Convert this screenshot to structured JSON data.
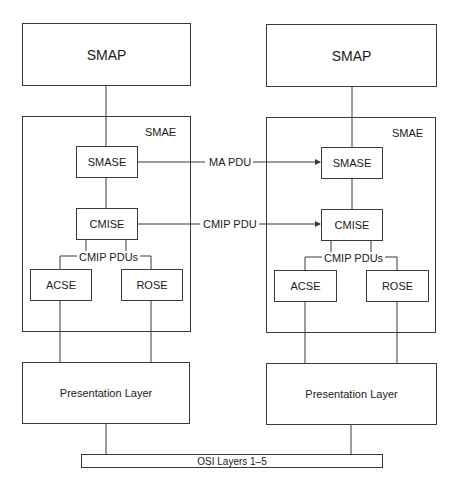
{
  "diagram": {
    "left_stack": {
      "smap": "SMAP",
      "smae": "SMAE",
      "smase": "SMASE",
      "cmise": "CMISE",
      "pdus_label": "CMIP PDUs",
      "acse": "ACSE",
      "rose": "ROSE",
      "presentation": "Presentation Layer"
    },
    "right_stack": {
      "smap": "SMAP",
      "smae": "SMAE",
      "smase": "SMASE",
      "cmise": "CMISE",
      "pdus_label": "CMIP PDUs",
      "acse": "ACSE",
      "rose": "ROSE",
      "presentation": "Presentation Layer"
    },
    "arrows": {
      "ma_pdu": "MA PDU",
      "cmip_pdu": "CMIP PDU"
    },
    "osi_bar": "OSI Layers 1–5",
    "colors": {
      "line": "#3a3a3a",
      "background": "#ffffff",
      "text": "#1a1a1a"
    }
  }
}
